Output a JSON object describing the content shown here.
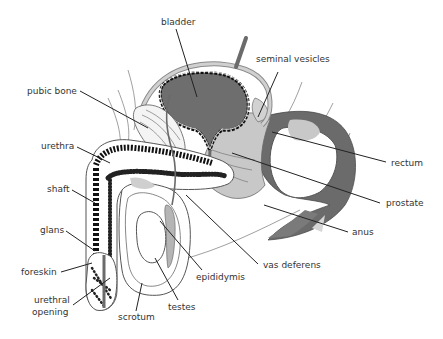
{
  "diagram": {
    "title": "",
    "colors": {
      "background": "#ffffff",
      "dark_tissue": "#6b6b6b",
      "light_tissue": "#c8c8c8",
      "pale_tissue": "#e6e6e6",
      "outline": "#5a5a5a",
      "leader_line": "#222222",
      "label_text": "#333333"
    },
    "labels": [
      {
        "id": "bladder",
        "text": "bladder",
        "x": 161,
        "y": 25
      },
      {
        "id": "seminal-vesicles",
        "text": "seminal vesicles",
        "x": 256,
        "y": 62
      },
      {
        "id": "pubic-bone",
        "text": "pubic bone",
        "x": 27,
        "y": 94
      },
      {
        "id": "urethra",
        "text": "urethra",
        "x": 41,
        "y": 149
      },
      {
        "id": "rectum",
        "text": "rectum",
        "x": 391,
        "y": 166
      },
      {
        "id": "shaft",
        "text": "shaft",
        "x": 47,
        "y": 192
      },
      {
        "id": "prostate",
        "text": "prostate",
        "x": 386,
        "y": 206
      },
      {
        "id": "glans",
        "text": "glans",
        "x": 40,
        "y": 233
      },
      {
        "id": "anus",
        "text": "anus",
        "x": 352,
        "y": 235
      },
      {
        "id": "vas-deferens",
        "text": "vas deferens",
        "x": 263,
        "y": 268
      },
      {
        "id": "foreskin",
        "text": "foreskin",
        "x": 21,
        "y": 275
      },
      {
        "id": "epididymis",
        "text": "epididymis",
        "x": 196,
        "y": 280
      },
      {
        "id": "urethral-opening-1",
        "text": "urethral",
        "x": 34,
        "y": 303
      },
      {
        "id": "urethral-opening-2",
        "text": "opening",
        "x": 32,
        "y": 315
      },
      {
        "id": "testes",
        "text": "testes",
        "x": 168,
        "y": 310
      },
      {
        "id": "scrotum",
        "text": "scrotum",
        "x": 118,
        "y": 320
      }
    ]
  }
}
